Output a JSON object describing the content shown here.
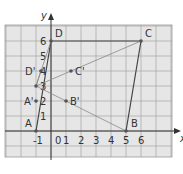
{
  "diagram": {
    "type": "coordinate-grid",
    "axes": {
      "x_label": "x",
      "y_label": "y",
      "x_ticks": [
        "-1",
        "0",
        "1",
        "2",
        "3",
        "4",
        "5",
        "6"
      ],
      "y_ticks": [
        "1",
        "2",
        "3",
        "4",
        "5",
        "6"
      ]
    },
    "points": [
      {
        "name": "A",
        "x": -1,
        "y": 0
      },
      {
        "name": "B",
        "x": 5,
        "y": 0
      },
      {
        "name": "C",
        "x": 6,
        "y": 6
      },
      {
        "name": "D",
        "x": 0,
        "y": 6
      },
      {
        "name": "A'",
        "x": -1,
        "y": 2
      },
      {
        "name": "B'",
        "x": 1,
        "y": 2
      },
      {
        "name": "C'",
        "x": 1.33,
        "y": 4
      },
      {
        "name": "D'",
        "x": -0.67,
        "y": 4
      },
      {
        "name": "",
        "x": -1,
        "y": 3
      }
    ],
    "colors": {
      "grid_bg": "#e6e6e6",
      "grid_line": "#9a9a9a",
      "axis": "#333333",
      "shape_line": "#444444",
      "ray_line": "#888888"
    }
  }
}
